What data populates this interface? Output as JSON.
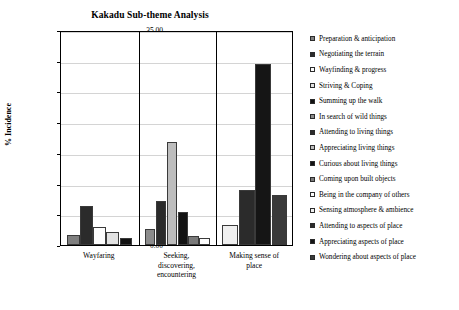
{
  "chart_data": {
    "type": "bar",
    "title": "Kakadu Sub-theme Analysis",
    "xlabel": "",
    "ylabel": "% Incidence",
    "ylim": [
      0,
      35
    ],
    "ytick_step": 5,
    "ytick_labels": [
      "0.00",
      "5.00",
      "10.00",
      "15.00",
      "20.00",
      "25.00",
      "30.00",
      "35.00"
    ],
    "grid": true,
    "legend_position": "right",
    "categories": [
      "Wayfaring",
      "Seeking, discovering, encountering",
      "Making sense of place"
    ],
    "series": [
      {
        "name": "Preparation & anticipation",
        "color": "#808080",
        "values": [
          1.7,
          0.0,
          0.0
        ]
      },
      {
        "name": "Negotiating the terrain",
        "color": "#2b2b2b",
        "values": [
          6.4,
          0.0,
          0.0
        ]
      },
      {
        "name": "Wayfinding & progress",
        "color": "#fdfdfd",
        "values": [
          3.0,
          0.0,
          0.0
        ]
      },
      {
        "name": "Striving & Coping",
        "color": "#e2e2e2",
        "values": [
          2.1,
          0.0,
          0.0
        ]
      },
      {
        "name": "Summing up the walk",
        "color": "#121212",
        "values": [
          1.1,
          0.0,
          0.0
        ]
      },
      {
        "name": "In search of wild things",
        "color": "#8c8c8c",
        "values": [
          0.0,
          2.6,
          0.0
        ]
      },
      {
        "name": "Attending to living things",
        "color": "#2b2b2b",
        "values": [
          0.0,
          7.1,
          0.0
        ]
      },
      {
        "name": "Appreciating living things",
        "color": "#bdbdbd",
        "values": [
          0.0,
          16.8,
          0.0
        ]
      },
      {
        "name": "Curious about living things",
        "color": "#121212",
        "values": [
          0.0,
          5.3,
          0.0
        ]
      },
      {
        "name": "Coming upon built objects",
        "color": "#7a7a7a",
        "values": [
          0.0,
          1.4,
          0.0
        ]
      },
      {
        "name": "Being in the company of others",
        "color": "#fdfdfd",
        "values": [
          0.0,
          1.2,
          0.0
        ]
      },
      {
        "name": "Sensing atmosphere & ambience",
        "color": "#f0f0f0",
        "values": [
          0.0,
          0.0,
          3.3
        ]
      },
      {
        "name": "Attending to aspects of place",
        "color": "#2b2b2b",
        "values": [
          0.0,
          0.0,
          9.0
        ]
      },
      {
        "name": "Appreciating aspects of place",
        "color": "#151515",
        "values": [
          0.0,
          0.0,
          29.4
        ]
      },
      {
        "name": "Wondering about aspects of place",
        "color": "#3a3a3a",
        "values": [
          0.0,
          0.0,
          8.1
        ]
      }
    ]
  },
  "caption": ""
}
